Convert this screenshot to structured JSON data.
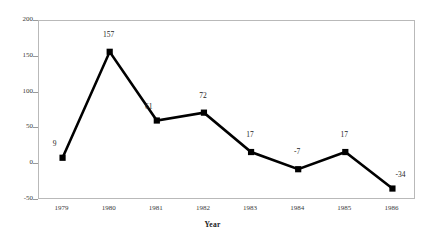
{
  "chart_data": {
    "type": "line",
    "title": "",
    "subtitle": "",
    "xlabel": "Year",
    "ylabel": "",
    "categories": [
      "1979",
      "1980",
      "1981",
      "1982",
      "1983",
      "1984",
      "1985",
      "1986"
    ],
    "values": [
      9,
      157,
      61,
      72,
      17,
      -7,
      17,
      -34
    ],
    "point_labels": [
      "9",
      "157",
      "61",
      "72",
      "17",
      "-7",
      "17",
      "-34"
    ],
    "series": [
      {
        "name": "",
        "values": [
          9,
          157,
          61,
          72,
          17,
          -7,
          17,
          -34
        ]
      }
    ],
    "ylim": [
      -50,
      200
    ],
    "yticks": [
      200,
      150,
      100,
      50,
      0,
      -50
    ],
    "ytick_labels": [
      "200",
      "150",
      "100",
      "50",
      "0",
      "-50"
    ],
    "xlim_padding_steps": 0.5,
    "grid": false,
    "legend": false,
    "legend_position": "none",
    "marker": "square",
    "line_color": "#000000",
    "marker_color": "#000000",
    "axis_color": "#b9b9b9",
    "background_color": "#ffffff",
    "label_offsets": [
      {
        "dx": -7,
        "dy": -9
      },
      {
        "dx": 0,
        "dy": -12
      },
      {
        "dx": -7,
        "dy": -9
      },
      {
        "dx": 0,
        "dy": -12
      },
      {
        "dx": 0,
        "dy": -12
      },
      {
        "dx": 0,
        "dy": -12
      },
      {
        "dx": 0,
        "dy": -12
      },
      {
        "dx": 9,
        "dy": -9
      }
    ]
  }
}
